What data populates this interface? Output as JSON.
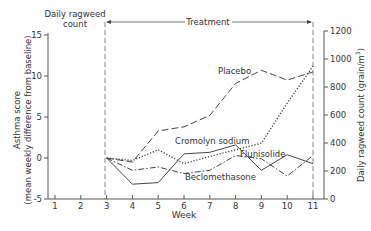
{
  "chart_data": {
    "type": "line",
    "title": "",
    "xlabel": "Week",
    "ylabel": "Asthma score (mean weekly difference from baseline)",
    "ylabel_line1": "Asthma score",
    "ylabel_line2": "(mean weekly difference from baseline)",
    "y2label": "Daily ragweed count (grain/m³)",
    "y2label_main": "Daily ragweed count (grain/m",
    "y2label_sup": "3",
    "y2label_end": ")",
    "xlim": [
      1,
      11
    ],
    "ylim": [
      -5,
      15
    ],
    "y2lim": [
      0,
      1200
    ],
    "x_ticks": [
      1,
      2,
      3,
      4,
      5,
      6,
      7,
      8,
      9,
      10,
      11
    ],
    "y_ticks": [
      -5,
      0,
      5,
      10,
      15
    ],
    "y2_ticks": [
      0,
      200,
      400,
      600,
      800,
      1000,
      1200
    ],
    "grid": false,
    "annotations": {
      "ragweed_period_label_line1": "Daily ragweed",
      "ragweed_period_label_line2": "count",
      "treatment_label": "Treatment",
      "treatment_start_week": 3,
      "treatment_end_week": 11
    },
    "x": [
      3,
      4,
      5,
      6,
      7,
      8,
      9,
      10,
      11
    ],
    "series": [
      {
        "name": "Placebo",
        "line_style": "long-dash",
        "values": [
          0,
          -0.5,
          3.3,
          3.8,
          5.2,
          9.1,
          10.7,
          9.5,
          10.5
        ]
      },
      {
        "name": "Cromolyn sodium",
        "line_style": "dotted",
        "values": [
          0,
          -0.3,
          1.0,
          -0.7,
          0.2,
          1.0,
          1.8,
          6.7,
          11.2
        ]
      },
      {
        "name": "Flunisolide",
        "line_style": "solid",
        "values": [
          0,
          -3.2,
          -3.0,
          0.5,
          0.7,
          1.6,
          -1.5,
          0.4,
          -0.7
        ]
      },
      {
        "name": "Beclomethasone",
        "line_style": "dash-dot",
        "values": [
          0,
          -1.5,
          -1.1,
          -1.9,
          -1.5,
          0.3,
          -0.1,
          -2.2,
          0.3
        ]
      }
    ],
    "series_labels": {
      "placebo": "Placebo",
      "cromolyn": "Cromolyn sodium",
      "flunisolide": "Flunisolide",
      "beclomethasone": "Beclomethasone"
    },
    "legend_position": "inline labels"
  },
  "colors": {
    "line": "#444444",
    "axis": "#555555",
    "text": "#333333"
  }
}
